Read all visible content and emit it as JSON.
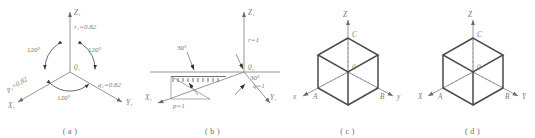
{
  "figure": {
    "background_color": "#ffffff",
    "line_color": "#8a8a8a",
    "bold_line_color": "#4a4a4a",
    "text_color": "#7a7a7a",
    "panel_count": 4
  },
  "panels": [
    {
      "id": "a",
      "caption": "( a )",
      "description": "Three coplanar-projected axes at 120 degrees with circular arrows",
      "origin_label": "0₁",
      "axes": [
        {
          "name": "z-axis",
          "label": "Z₁",
          "direction": "up"
        },
        {
          "name": "x-axis",
          "label": "X₁",
          "direction": "lower-left"
        },
        {
          "name": "y-axis",
          "label": "Y₁",
          "direction": "lower-right"
        }
      ],
      "angles": [
        {
          "name": "angle-upper-left",
          "value": "120°"
        },
        {
          "name": "angle-upper-right",
          "value": "120°"
        },
        {
          "name": "angle-bottom",
          "value": "120°"
        }
      ],
      "ratios": [
        {
          "name": "ratio-r",
          "value": "r₁=0.82"
        },
        {
          "name": "ratio-p",
          "value": "p₁=0.82"
        },
        {
          "name": "ratio-q",
          "value": "q₁=0.82"
        }
      ]
    },
    {
      "id": "b",
      "caption": "( b )",
      "description": "Dimetric-style axes with 30 degree angles to the ground line",
      "origin_label": "0₁",
      "axes": [
        {
          "name": "z-axis",
          "label": "Z₁",
          "direction": "up"
        },
        {
          "name": "x-axis",
          "label": "X₁",
          "direction": "lower-left"
        },
        {
          "name": "y-axis",
          "label": "Y₁",
          "direction": "lower-right"
        }
      ],
      "angles": [
        {
          "name": "angle-left-30",
          "value": "30°"
        },
        {
          "name": "angle-right-30",
          "value": "30°"
        }
      ],
      "ratios": [
        {
          "name": "ratio-r",
          "value": "r=1"
        },
        {
          "name": "ratio-p",
          "value": "p=1"
        },
        {
          "name": "ratio-q",
          "value": "q=1"
        }
      ]
    },
    {
      "id": "c",
      "caption": "( c )",
      "description": "Isometric cube with labelled vertices",
      "origin_label": "0",
      "axes": [
        {
          "name": "z-axis",
          "label": "Z",
          "direction": "up"
        },
        {
          "name": "x-axis",
          "label": "x",
          "direction": "lower-left"
        },
        {
          "name": "y-axis",
          "label": "y",
          "direction": "lower-right"
        }
      ],
      "vertices": [
        {
          "name": "vertex-c",
          "label": "C"
        },
        {
          "name": "vertex-a",
          "label": "A"
        },
        {
          "name": "vertex-b",
          "label": "B"
        }
      ]
    },
    {
      "id": "d",
      "caption": "( d )",
      "description": "Isometric cube with labelled vertices, uppercase axis names",
      "origin_label": "0",
      "axes": [
        {
          "name": "z-axis",
          "label": "Z",
          "direction": "up"
        },
        {
          "name": "x-axis",
          "label": "X",
          "direction": "lower-left"
        },
        {
          "name": "y-axis",
          "label": "Y",
          "direction": "lower-right"
        }
      ],
      "vertices": [
        {
          "name": "vertex-c",
          "label": "C"
        },
        {
          "name": "vertex-a",
          "label": "A"
        },
        {
          "name": "vertex-b",
          "label": "B"
        }
      ]
    }
  ]
}
